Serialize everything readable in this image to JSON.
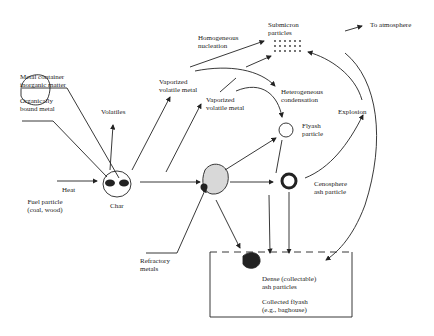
{
  "diagram": {
    "labels": {
      "metal_container": [
        "Metal container",
        "inorganic matter"
      ],
      "organic_metal": [
        "Organically",
        "bound metal"
      ],
      "volatiles": "Volatiles",
      "vaporized1": [
        "Vaporized",
        "volatile metal"
      ],
      "vaporized2": [
        "Vaporized",
        "volatile metal"
      ],
      "homogeneous": [
        "Homogeneous",
        "nucleation"
      ],
      "submicron": [
        "Submicron",
        "particles"
      ],
      "to_atmosphere": "To atmosphere",
      "heterogeneous": [
        "Heterogeneous",
        "condensation"
      ],
      "explosion": "Explosion",
      "flyash_particle": [
        "Flyash",
        "particle"
      ],
      "cenosphere": [
        "Cenosphere",
        "ash particle"
      ],
      "fuel_particle": [
        "Fuel particle",
        "(coal, wood)"
      ],
      "heat": "Heat",
      "char": "Char",
      "refractory": [
        "Refractory",
        "metals"
      ],
      "dense": [
        "Dense (collectable)",
        "ash particles"
      ],
      "collected": [
        "Collected flyash",
        "(e.g., baghouse)"
      ]
    },
    "colors": {
      "ink": "#222222",
      "shade": "#d8d8d8"
    }
  }
}
